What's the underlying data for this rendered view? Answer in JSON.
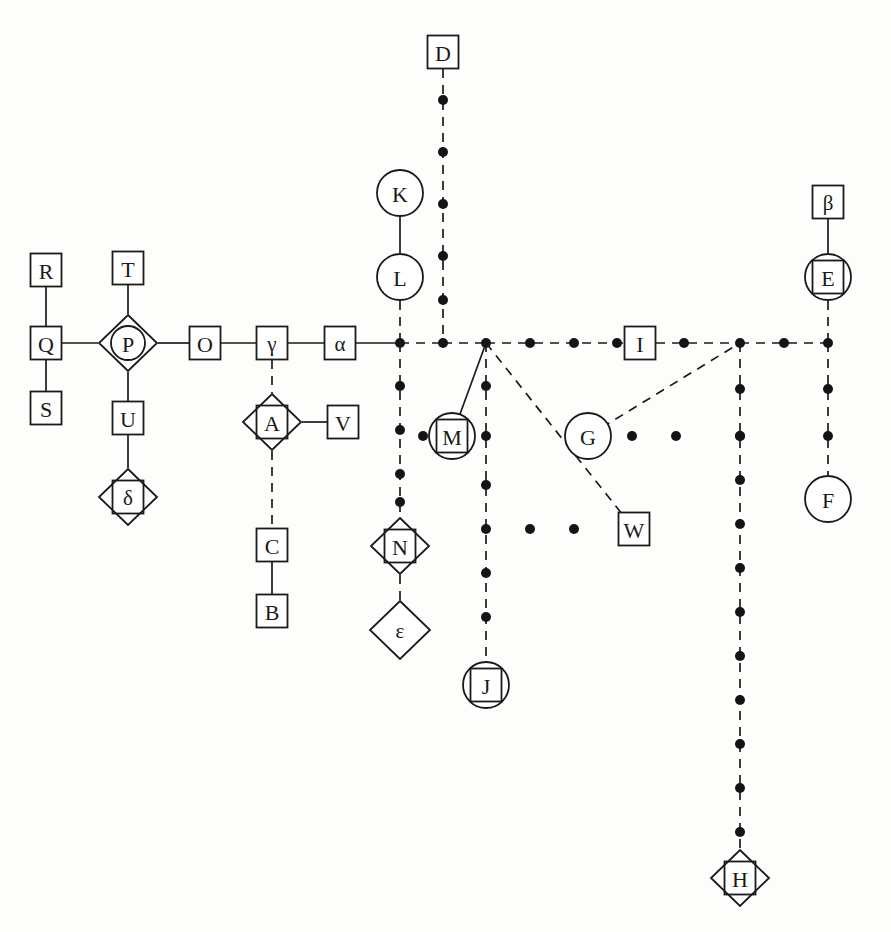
{
  "figure": {
    "title": "",
    "background_color": "#fdfdfc",
    "ink_color": "#1a1a1a",
    "width": 891,
    "height": 932
  },
  "chart_data": {
    "type": "diagram",
    "subtype": "node-link graph",
    "title": "",
    "shape_legend": {
      "square": "square box node",
      "circle": "circle node",
      "diamond": "diamond node",
      "circle-in-diamond": "circle inscribed in diamond",
      "square-in-diamond": "square inscribed in diamond",
      "square-in-circle": "square inscribed in circle"
    },
    "nodes": [
      {
        "id": "D",
        "label": "D",
        "shape": "square",
        "x": 443,
        "y": 52
      },
      {
        "id": "K",
        "label": "K",
        "shape": "circle",
        "x": 400,
        "y": 193
      },
      {
        "id": "beta",
        "label": "β",
        "shape": "square",
        "x": 828,
        "y": 202
      },
      {
        "id": "R",
        "label": "R",
        "shape": "square",
        "x": 46,
        "y": 270
      },
      {
        "id": "T",
        "label": "T",
        "shape": "square",
        "x": 128,
        "y": 268
      },
      {
        "id": "L",
        "label": "L",
        "shape": "circle",
        "x": 400,
        "y": 277
      },
      {
        "id": "E",
        "label": "E",
        "shape": "square-in-circle",
        "x": 828,
        "y": 277
      },
      {
        "id": "Q",
        "label": "Q",
        "shape": "square",
        "x": 46,
        "y": 343
      },
      {
        "id": "P",
        "label": "P",
        "shape": "circle-in-diamond",
        "x": 128,
        "y": 343
      },
      {
        "id": "O",
        "label": "O",
        "shape": "square",
        "x": 205,
        "y": 343
      },
      {
        "id": "gamma",
        "label": "γ",
        "shape": "square",
        "x": 272,
        "y": 343
      },
      {
        "id": "alpha",
        "label": "α",
        "shape": "square",
        "x": 340,
        "y": 343
      },
      {
        "id": "I",
        "label": "I",
        "shape": "square",
        "x": 640,
        "y": 343
      },
      {
        "id": "S",
        "label": "S",
        "shape": "square",
        "x": 46,
        "y": 408
      },
      {
        "id": "U",
        "label": "U",
        "shape": "square",
        "x": 128,
        "y": 418
      },
      {
        "id": "A",
        "label": "A",
        "shape": "square-in-diamond",
        "x": 272,
        "y": 422
      },
      {
        "id": "V",
        "label": "V",
        "shape": "square",
        "x": 343,
        "y": 422
      },
      {
        "id": "M",
        "label": "M",
        "shape": "square-in-circle",
        "x": 452,
        "y": 436
      },
      {
        "id": "G",
        "label": "G",
        "shape": "circle",
        "x": 588,
        "y": 436
      },
      {
        "id": "delta",
        "label": "δ",
        "shape": "square-in-diamond",
        "x": 128,
        "y": 497
      },
      {
        "id": "F",
        "label": "F",
        "shape": "circle",
        "x": 828,
        "y": 499
      },
      {
        "id": "C",
        "label": "C",
        "shape": "square",
        "x": 272,
        "y": 545
      },
      {
        "id": "N",
        "label": "N",
        "shape": "square-in-diamond",
        "x": 400,
        "y": 546
      },
      {
        "id": "W",
        "label": "W",
        "shape": "square",
        "x": 634,
        "y": 529
      },
      {
        "id": "B",
        "label": "B",
        "shape": "square",
        "x": 272,
        "y": 611
      },
      {
        "id": "epsilon",
        "label": "ε",
        "shape": "diamond",
        "x": 400,
        "y": 630
      },
      {
        "id": "J",
        "label": "J",
        "shape": "square-in-circle",
        "x": 486,
        "y": 685
      },
      {
        "id": "H",
        "label": "H",
        "shape": "square-in-diamond",
        "x": 740,
        "y": 878
      }
    ],
    "edges": [
      {
        "from": "R",
        "to": "Q",
        "style": "solid"
      },
      {
        "from": "Q",
        "to": "S",
        "style": "solid"
      },
      {
        "from": "Q",
        "to": "P",
        "style": "solid"
      },
      {
        "from": "T",
        "to": "P",
        "style": "solid"
      },
      {
        "from": "P",
        "to": "U",
        "style": "solid"
      },
      {
        "from": "U",
        "to": "delta",
        "style": "solid"
      },
      {
        "from": "P",
        "to": "O",
        "style": "solid"
      },
      {
        "from": "O",
        "to": "gamma",
        "style": "solid"
      },
      {
        "from": "gamma",
        "to": "alpha",
        "style": "solid"
      },
      {
        "from": "gamma",
        "to": "A",
        "style": "dotted"
      },
      {
        "from": "A",
        "to": "V",
        "style": "solid"
      },
      {
        "from": "A",
        "to": "C",
        "style": "dotted"
      },
      {
        "from": "C",
        "to": "B",
        "style": "solid"
      },
      {
        "from": "alpha",
        "to": "j1",
        "style": "solid"
      },
      {
        "from": "K",
        "to": "L",
        "style": "solid"
      },
      {
        "from": "L",
        "to": "j1",
        "style": "dotted"
      },
      {
        "from": "j1",
        "to": "N",
        "style": "dotted"
      },
      {
        "from": "N",
        "to": "epsilon",
        "style": "dotted"
      },
      {
        "from": "D",
        "to": "j2",
        "style": "dotted"
      },
      {
        "from": "j1",
        "to": "j2",
        "style": "dotted"
      },
      {
        "from": "j2",
        "to": "j3",
        "style": "dotted"
      },
      {
        "from": "j3",
        "to": "I",
        "style": "dotted"
      },
      {
        "from": "I",
        "to": "j4",
        "style": "dotted"
      },
      {
        "from": "j4",
        "to": "j5",
        "style": "dotted"
      },
      {
        "from": "j3",
        "to": "M",
        "style": "solid"
      },
      {
        "from": "j3",
        "to": "J",
        "style": "dotted"
      },
      {
        "from": "j3",
        "to": "W",
        "style": "dotted"
      },
      {
        "from": "G",
        "to": "j4",
        "style": "dotted"
      },
      {
        "from": "j4",
        "to": "H",
        "style": "dotted"
      },
      {
        "from": "beta",
        "to": "E",
        "style": "solid"
      },
      {
        "from": "E",
        "to": "j5",
        "style": "dotted"
      },
      {
        "from": "j5",
        "to": "F",
        "style": "dotted"
      }
    ],
    "junction_labels": {
      "j1": "junction below L on main line",
      "j2": "junction below D on main line",
      "j3": "junction above M on main line",
      "j4": "junction above H column on main line",
      "j5": "junction below E on main line"
    }
  }
}
